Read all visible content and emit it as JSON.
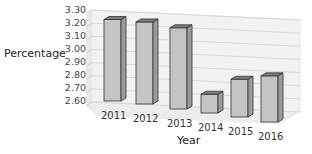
{
  "chart_data": {
    "type": "bar",
    "style": "3d",
    "title": "",
    "xlabel": "Year",
    "ylabel": "Percentage",
    "categories": [
      "2011",
      "2012",
      "2013",
      "2014",
      "2015",
      "2016"
    ],
    "values": [
      3.22,
      3.22,
      3.21,
      2.74,
      2.88,
      2.94
    ],
    "ylim": [
      2.6,
      3.3
    ],
    "yticks": [
      "3.30",
      "3.20",
      "3.10",
      "3.00",
      "2.90",
      "2.80",
      "2.70",
      "2.60"
    ],
    "grid": true,
    "legend": null,
    "colors": {
      "bar_front": "#c4c4c4",
      "bar_side": "#9a9a9a",
      "bar_top": "#7d7d7d",
      "grid": "#d8d8d8",
      "wall": "#f2f2f2"
    }
  }
}
